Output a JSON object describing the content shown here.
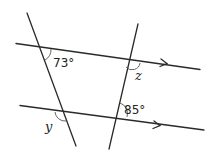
{
  "diagram": {
    "type": "parallel lines cut by transversals",
    "angles": {
      "top_left": "73°",
      "top_right": "z",
      "bottom_left": "y",
      "bottom_right": "85°"
    },
    "parallel_marker": "single arrow on each parallel line"
  }
}
